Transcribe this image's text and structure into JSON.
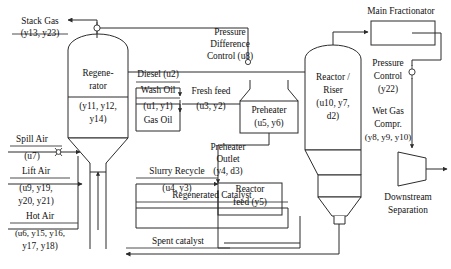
{
  "diagram": {
    "type": "process-flow-diagram",
    "colors": {
      "line": "#2b2b2b",
      "text": "#111111",
      "background": "#ffffff"
    }
  },
  "labels": {
    "stack_gas": {
      "line1": "Stack Gas",
      "line2": "(y13, y23)"
    },
    "pressure_difference_control": {
      "line1": "Pressure",
      "line2": "Difference",
      "line3": "Control (u8)"
    },
    "main_fractionator": {
      "line1": "Main Fractionator"
    },
    "regenerator": {
      "line1": "Regene-",
      "line2": "rator",
      "line3": "(y11, y12,",
      "line4": "y14)"
    },
    "diesel": {
      "line1": "Diesel (u2)"
    },
    "wash_oil": {
      "line1": "Wash Oil",
      "line2": "(u1, y1)",
      "line3": "Gas Oil"
    },
    "fresh_feed": {
      "line1": "Fresh feed",
      "line2": "(u3, y2)"
    },
    "preheater": {
      "line1": "Preheater",
      "line2": "(u5, y6)"
    },
    "preheater_outlet": {
      "line1": "Preheater",
      "line2": "Outlet",
      "line3": "(y4, d3)"
    },
    "reactor_riser": {
      "line1": "Reactor /",
      "line2": "Riser",
      "line3": "(u10, y7,",
      "line4": "d2)"
    },
    "pressure_control": {
      "line1": "Pressure",
      "line2": "Control",
      "line3": "(y22)"
    },
    "wet_gas_compressor": {
      "line1": "Wet Gas",
      "line2": "Compr.",
      "line3": "(y8, y9, y10)"
    },
    "downstream_separation": {
      "line1": "Downstream",
      "line2": "Separation"
    },
    "spill_air": {
      "line1": "Spill Air",
      "line2": "(u7)"
    },
    "lift_air": {
      "line1": "Lift Air",
      "line2": "(u9, y19,",
      "line3": "y20, y21)"
    },
    "hot_air": {
      "line1": "Hot Air",
      "line2": "(u6, y15, y16,",
      "line3": "y17, y18)"
    },
    "slurry_recycle": {
      "line1": "Slurry Recycle",
      "line2": "(u4, y3)"
    },
    "regenerated_catalyst": {
      "line1": "Regenerated Catalyst"
    },
    "spent_catalyst": {
      "line1": "Spent catalyst"
    },
    "reactor_feed": {
      "line1": "Reactor",
      "line2": "feed (y5)"
    }
  },
  "variables": {
    "manipulated": [
      "u1",
      "u2",
      "u3",
      "u4",
      "u5",
      "u6",
      "u7",
      "u8",
      "u9",
      "u10"
    ],
    "measured": [
      "y1",
      "y2",
      "y3",
      "y4",
      "y5",
      "y6",
      "y7",
      "y8",
      "y9",
      "y10",
      "y11",
      "y12",
      "y13",
      "y14",
      "y15",
      "y16",
      "y17",
      "y18",
      "y19",
      "y20",
      "y21",
      "y22",
      "y23"
    ],
    "disturbances": [
      "d2",
      "d3"
    ]
  },
  "equipment": [
    {
      "name": "regenerator",
      "shape": "vertical-vessel-dome-top-cone-bottom"
    },
    {
      "name": "reactor-riser",
      "shape": "vertical-vessel-dome-top-cone-bottom"
    },
    {
      "name": "preheater",
      "shape": "furnace-box"
    },
    {
      "name": "main-fractionator",
      "shape": "rectangle"
    },
    {
      "name": "wet-gas-compressor",
      "shape": "trapezoid"
    }
  ]
}
